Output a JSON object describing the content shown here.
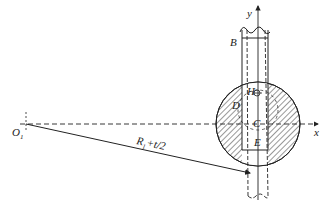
{
  "diagram": {
    "type": "geometric-mechanical-diagram",
    "labels": {
      "origin": "O",
      "origin_sub": "1",
      "radius": "R",
      "radius_sub": "1",
      "radius_suffix": "+t/2",
      "x_axis": "x",
      "y_axis": "y",
      "point_B": "B",
      "point_C": "C",
      "point_D": "D",
      "point_E": "E",
      "point_H": "H"
    },
    "colors": {
      "line": "#222222",
      "background": "#ffffff"
    }
  }
}
